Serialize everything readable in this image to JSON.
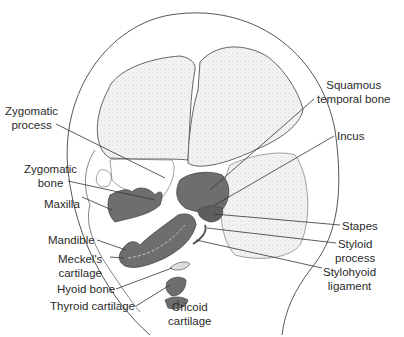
{
  "figure": {
    "colors": {
      "background": "#ffffff",
      "outline": "#444444",
      "stipple_bone": "#e9e9e9",
      "dark_cartilage": "#6e6e6e",
      "leader_line": "#333333",
      "text": "#2a2a2a"
    }
  },
  "labels": {
    "zygomatic_process": {
      "line1": "Zygomatic",
      "line2": "process"
    },
    "zygomatic_bone": {
      "line1": "Zygomatic",
      "line2": "bone"
    },
    "maxilla": "Maxilla",
    "mandible": "Mandible",
    "meckels_cartilage": {
      "line1": "Meckel's",
      "line2": "cartilage"
    },
    "hyoid_bone": "Hyoid bone",
    "thyroid_cartilage": "Thyroid cartilage",
    "cricoid_cartilage": {
      "line1": "Cricoid",
      "line2": "cartilage"
    },
    "squamous_temporal_bone": {
      "line1": "Squamous",
      "line2": "temporal bone"
    },
    "incus": "Incus",
    "stapes": "Stapes",
    "styloid_process": {
      "line1": "Styloid",
      "line2": "process"
    },
    "stylohyoid_ligament": {
      "line1": "Stylohyoid",
      "line2": "ligament"
    }
  }
}
